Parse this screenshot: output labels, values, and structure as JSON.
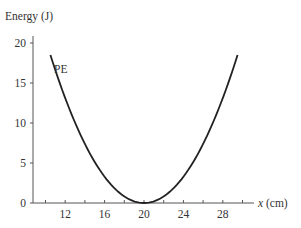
{
  "chart_data": {
    "type": "line",
    "title": "",
    "xlabel": "x (cm)",
    "ylabel": "Energy (J)",
    "xlim": [
      8,
      31
    ],
    "ylim": [
      0,
      21
    ],
    "xticks": [
      10,
      12,
      14,
      16,
      18,
      20,
      22,
      24,
      26,
      28,
      30
    ],
    "xtick_labels": [
      "12",
      "16",
      "20",
      "24",
      "28"
    ],
    "xtick_label_values": [
      12,
      16,
      20,
      24,
      28
    ],
    "yticks": [
      0,
      5,
      10,
      15,
      20
    ],
    "ytick_labels": [
      "0",
      "5",
      "10",
      "15",
      "20"
    ],
    "grid": false,
    "legend": "none",
    "annotations": [
      {
        "text": "PE",
        "x": 11.5,
        "y": 16.5
      }
    ],
    "series": [
      {
        "name": "PE",
        "formula": "E = 0.2 (x - 20)^2",
        "x": [
          10.5,
          12,
          14,
          16,
          18,
          20,
          22,
          24,
          26,
          28,
          29.5
        ],
        "values": [
          18.5,
          12.8,
          7.2,
          3.2,
          0.8,
          0,
          0.8,
          3.2,
          7.2,
          12.8,
          18.5
        ]
      }
    ],
    "colors": {
      "curve": "#222222",
      "axes": "#555555",
      "text": "#333333"
    }
  }
}
